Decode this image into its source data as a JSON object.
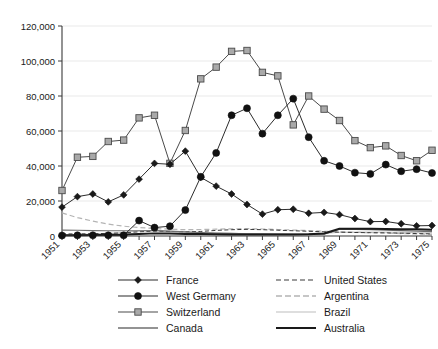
{
  "chart_data": {
    "type": "line",
    "title": "",
    "subtitle": "",
    "xlabel": "",
    "ylabel": "",
    "xlim": [
      1951,
      1975
    ],
    "ylim": [
      0,
      120000
    ],
    "ytick_labels": [
      "0",
      "20,000",
      "40,000",
      "60,000",
      "80,000",
      "100,000",
      "120,000"
    ],
    "ytick_values": [
      0,
      20000,
      40000,
      60000,
      80000,
      100000,
      120000
    ],
    "xtick_labels": [
      "1951",
      "1953",
      "1955",
      "1957",
      "1959",
      "1961",
      "1963",
      "1965",
      "1967",
      "1969",
      "1971",
      "1973",
      "1975"
    ],
    "xtick_values": [
      1951,
      1953,
      1955,
      1957,
      1959,
      1961,
      1963,
      1965,
      1967,
      1969,
      1971,
      1973,
      1975
    ],
    "minor_xticks": [
      1952,
      1954,
      1956,
      1958,
      1960,
      1962,
      1964,
      1966,
      1968,
      1970,
      1972,
      1974
    ],
    "x": [
      1951,
      1952,
      1953,
      1954,
      1955,
      1956,
      1957,
      1958,
      1959,
      1960,
      1961,
      1962,
      1963,
      1964,
      1965,
      1966,
      1967,
      1968,
      1969,
      1970,
      1971,
      1972,
      1973,
      1974,
      1975
    ],
    "grid": "horizontal",
    "legend_position": "bottom",
    "legend_columns": 2,
    "series": [
      {
        "name": "France",
        "marker": "diamond",
        "line_color": "#2b2b2b",
        "marker_color": "#1a1a1a",
        "line_width": 1.0,
        "dash": "none",
        "values": [
          16500,
          22500,
          24000,
          19500,
          23500,
          32500,
          41500,
          41000,
          48500,
          33500,
          28500,
          24000,
          18000,
          12500,
          15000,
          15300,
          13000,
          13500,
          12200,
          10000,
          8200,
          8300,
          7000,
          5800,
          6000
        ]
      },
      {
        "name": "West Germany",
        "marker": "circle",
        "line_color": "#2b2b2b",
        "marker_color": "#111111",
        "line_width": 1.0,
        "dash": "none",
        "values": [
          300,
          400,
          400,
          400,
          400,
          8800,
          4800,
          5600,
          14800,
          33800,
          47500,
          69000,
          73000,
          58500,
          69000,
          78500,
          56500,
          43000,
          40000,
          36200,
          35500,
          40800,
          37000,
          38200,
          36000
        ]
      },
      {
        "name": "Switzerland",
        "marker": "square",
        "line_color": "#4a4a4a",
        "marker_color": "#a9a9a9",
        "line_width": 1.0,
        "dash": "none",
        "values": [
          26000,
          45000,
          45500,
          54000,
          54800,
          67500,
          69000,
          41500,
          60300,
          89800,
          96500,
          105500,
          106000,
          93500,
          91500,
          63500,
          80000,
          72500,
          66000,
          54500,
          50500,
          51500,
          46000,
          43000,
          49000
        ]
      },
      {
        "name": "Canada",
        "marker": "none",
        "line_color": "#6f6f6f",
        "marker_color": "#6f6f6f",
        "line_width": 1.2,
        "dash": "none",
        "values": [
          3400,
          3300,
          3100,
          3000,
          3000,
          3000,
          3100,
          2800,
          2400,
          2000,
          1700,
          1500,
          1300,
          1200,
          1100,
          1000,
          1000,
          1100,
          3900,
          3800,
          3600,
          3400,
          3100,
          2800,
          2500
        ]
      },
      {
        "name": "United States",
        "marker": "none",
        "line_color": "#3a3a3a",
        "marker_color": "#3a3a3a",
        "line_width": 1.0,
        "dash": "dashed",
        "values": [
          1200,
          1200,
          1300,
          1500,
          1800,
          2400,
          2800,
          2600,
          2400,
          2600,
          3200,
          3600,
          3800,
          3600,
          3300,
          3000,
          2700,
          2400,
          2200,
          2000,
          1900,
          1800,
          1600,
          1400,
          1200
        ]
      },
      {
        "name": "Argentina",
        "marker": "none",
        "line_color": "#b4b4b4",
        "marker_color": "#b4b4b4",
        "line_width": 1.2,
        "dash": "dashed",
        "values": [
          13200,
          10500,
          8500,
          6800,
          5600,
          4800,
          4300,
          3900,
          3600,
          3700,
          3900,
          4100,
          4200,
          4000,
          3700,
          3400,
          3100,
          2700,
          2400,
          2100,
          1900,
          1700,
          1400,
          1200,
          900
        ]
      },
      {
        "name": "Brazil",
        "marker": "none",
        "line_color": "#bdbdbd",
        "marker_color": "#bdbdbd",
        "line_width": 1.0,
        "dash": "none",
        "values": [
          700,
          900,
          1100,
          1400,
          2000,
          2900,
          3100,
          2600,
          2100,
          1800,
          1600,
          1500,
          1400,
          1300,
          1300,
          1300,
          1400,
          1500,
          2100,
          2200,
          2200,
          2200,
          2100,
          1900,
          1700
        ]
      },
      {
        "name": "Australia",
        "marker": "none",
        "line_color": "#1a1a1a",
        "marker_color": "#1a1a1a",
        "line_width": 2.0,
        "dash": "none",
        "values": [
          500,
          500,
          600,
          700,
          800,
          1200,
          1500,
          1400,
          1200,
          1100,
          1000,
          900,
          900,
          900,
          900,
          900,
          1000,
          1400,
          4100,
          4200,
          4100,
          4000,
          3900,
          3800,
          3600
        ]
      }
    ]
  },
  "legend": {
    "left_column": [
      {
        "label": "France",
        "key": "line-diamond-marker"
      },
      {
        "label": "West Germany",
        "key": "line-circle-marker"
      },
      {
        "label": "Switzerland",
        "key": "line-square-marker"
      },
      {
        "label": "Canada",
        "key": "line-plain-gray"
      }
    ],
    "right_column": [
      {
        "label": "United States",
        "key": "line-dashed-dark"
      },
      {
        "label": "Argentina",
        "key": "line-dashed-light"
      },
      {
        "label": "Brazil",
        "key": "line-plain-light"
      },
      {
        "label": "Australia",
        "key": "line-thick-dark"
      }
    ]
  }
}
